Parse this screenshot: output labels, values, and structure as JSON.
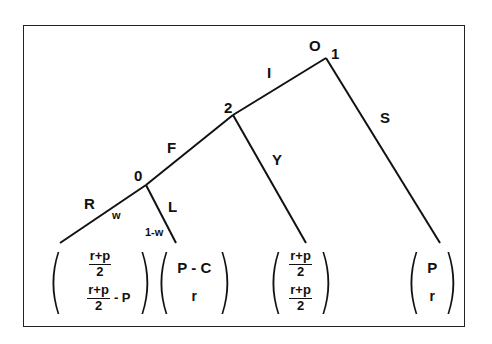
{
  "diagram": {
    "type": "game-tree",
    "nodes": {
      "root": {
        "player": "1",
        "label_above": "O"
      },
      "second": {
        "player": "2"
      },
      "chance": {
        "player": "0"
      }
    },
    "edges": {
      "I": "I",
      "S": "S",
      "F": "F",
      "Y": "Y",
      "R": "R",
      "L": "L"
    },
    "probabilities": {
      "R": "w",
      "L": "1-w"
    },
    "payoffs": [
      {
        "id": "R-leaf",
        "top": {
          "num": "r+p",
          "den": "2"
        },
        "bottom": {
          "num": "r+p",
          "den": "2",
          "suffix": "- P"
        }
      },
      {
        "id": "L-leaf",
        "top": "P - C",
        "bottom": "r"
      },
      {
        "id": "Y-leaf",
        "top": {
          "num": "r+p",
          "den": "2"
        },
        "bottom": {
          "num": "r+p",
          "den": "2"
        }
      },
      {
        "id": "S-leaf",
        "top": "P",
        "bottom": "r"
      }
    ],
    "colors": {
      "line": "#111111",
      "background": "#ffffff"
    }
  }
}
